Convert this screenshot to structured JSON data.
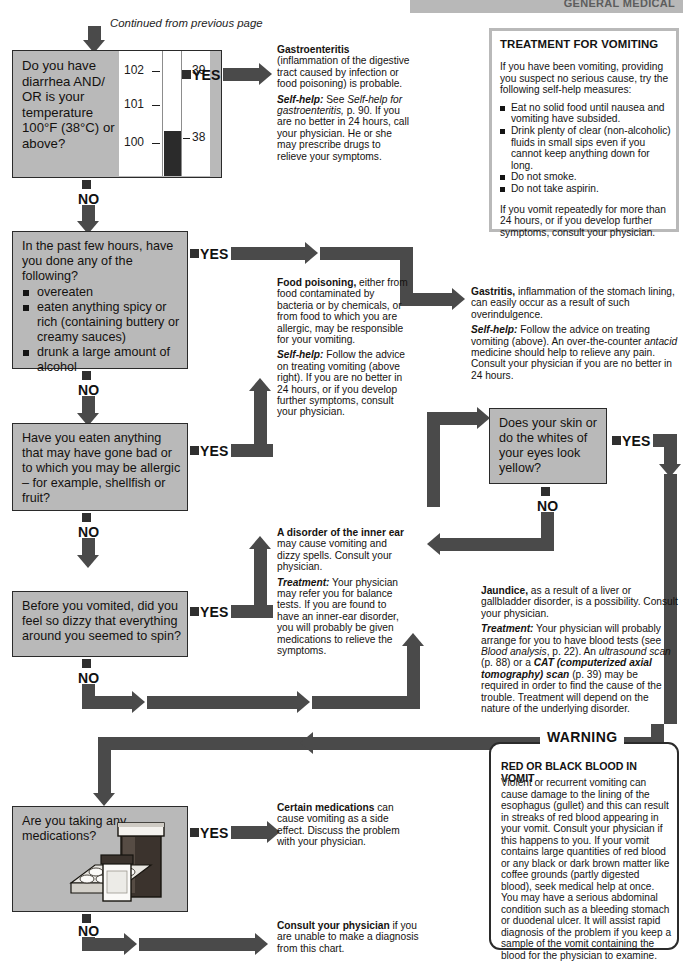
{
  "header": {
    "title": "GENERAL MEDICAL"
  },
  "continued_note": "Continued from previous page",
  "questions": [
    {
      "id": "q1",
      "text": "Do you have diarrhea AND/ OR is your temperature 100°F (38°C) or above?",
      "yes_label": "YES",
      "no_label": "NO",
      "illustration": "thermometer-icon"
    },
    {
      "id": "q2",
      "lead": "In the past few hours, have you done any of the following?",
      "bullets": [
        "overeaten",
        "eaten anything spicy or rich (containing buttery or creamy sauces)",
        "drunk a large amount of alcohol"
      ],
      "yes_label": "YES",
      "no_label": "NO"
    },
    {
      "id": "q3",
      "text": "Have you eaten anything that may have gone bad or to which you may be allergic – for example, shellfish or fruit?",
      "yes_label": "YES",
      "no_label": "NO"
    },
    {
      "id": "q4",
      "text": "Before you vomited, did you feel so dizzy that everything around you seemed to spin?",
      "yes_label": "YES",
      "no_label": "NO"
    },
    {
      "id": "q5",
      "text": "Does your skin or do the whites of your eyes look yellow?",
      "yes_label": "YES",
      "no_label": "NO"
    },
    {
      "id": "q6",
      "text": "Are you taking any medications?",
      "yes_label": "YES",
      "no_label": "NO",
      "illustration": "pill-bottles-icon"
    }
  ],
  "outcomes": {
    "gastroenteritis": {
      "title": "Gastroenteritis",
      "body_1": " (inflammation of the digestive tract caused by infection or food poisoning) is probable.",
      "label_2": "Self-help:",
      "body_2a": " See ",
      "italic_2": "Self-help for gastroenteritis,",
      "body_2b": " p. 90. If you are no better in 24 hours, call your physician. He or she may prescribe drugs to relieve your symptoms."
    },
    "food_poisoning": {
      "title": "Food poisoning,",
      "body_1": " either from food contaminated by bacteria or by chemicals, or from food to which you are allergic, may be responsible for your vomiting.",
      "label_2": "Self-help:",
      "body_2": " Follow the advice on treating vomiting (above right). If you are no better in 24 hours, or if you develop further symptoms, consult your physician."
    },
    "gastritis": {
      "title": "Gastritis,",
      "body_1": " inflammation of the stomach lining, can easily occur as a result of such overindulgence.",
      "label_2": "Self-help:",
      "body_2a": " Follow the advice on treating vomiting (above). An over-the-counter ",
      "italic_2": "antacid",
      "body_2b": " medicine should help to relieve any pain. Consult your physician if you are no better in 24 hours."
    },
    "inner_ear": {
      "title": "A disorder of the inner ear",
      "body_1": " may cause vomiting and dizzy spells. Consult your physician.",
      "label_2": "Treatment:",
      "body_2": " Your physician may refer you for balance tests. If you are found to have an inner-ear disorder, you will probably be given medications to relieve the symptoms."
    },
    "jaundice": {
      "title": "Jaundice,",
      "body_1": " as a result of a liver or gallbladder disorder, is a possibility. Consult your physician.",
      "label_2": "Treatment:",
      "body_2a": " Your physician will probably arrange for you to have blood tests (see ",
      "italic_2a": "Blood analysis",
      "body_2b": ", p. 22). An ",
      "italic_2b": "ultrasound scan",
      "body_2c": " (p. 88) or a ",
      "italic_2c": "CAT (computerized axial tomography) scan",
      "body_2d": " (p. 39) may be required in order to find the cause of the trouble. Treatment will depend on the nature of the underlying disorder."
    },
    "medications": {
      "title": "Certain medications",
      "body_1": " can cause vomiting as a side effect. Discuss the problem with your physician."
    },
    "consult": {
      "title": "Consult your physician",
      "body_1": " if you are unable to make a diagnosis from this chart."
    }
  },
  "panels": {
    "treatment": {
      "title": "TREATMENT FOR VOMITING",
      "intro": "If you have been vomiting, providing you suspect no serious cause, try the following self-help measures:",
      "items": [
        "Eat no solid food until nausea and vomiting have subsided.",
        "Drink plenty of clear (non-alcoholic) fluids in small sips even if you cannot keep anything down for long.",
        "Do not smoke.",
        "Do not take aspirin."
      ],
      "outro": "If you vomit repeatedly for more than 24 hours, or if you develop further symptoms, consult your physician."
    },
    "warning": {
      "label": "WARNING",
      "title": "RED OR BLACK BLOOD IN VOMIT",
      "body_1": "Violent or recurrent vomiting can cause damage to the lining of the esophagus (gullet) and this can result in streaks of red blood appearing in your vomit. Consult your physician if this happens to you. If your vomit contains large quantities of red blood or any black or dark brown matter like coffee grounds (partly digested blood), ",
      "emphasis": "seek medical help at once",
      "body_2": ". You may have a serious abdominal condition such as a bleeding stomach or duodenal ulcer. It will assist rapid diagnosis of the problem if you keep a sample of the vomit containing the blood for the physician to examine."
    }
  },
  "thermometer": {
    "f_labels": [
      "102",
      "101",
      "100"
    ],
    "c_labels": [
      "39",
      "38"
    ]
  },
  "colors": {
    "box_fill": "#b9b9b9",
    "arrow": "#4a4a4a",
    "ink": "#141414",
    "panel_border": "#b9b9b9"
  }
}
